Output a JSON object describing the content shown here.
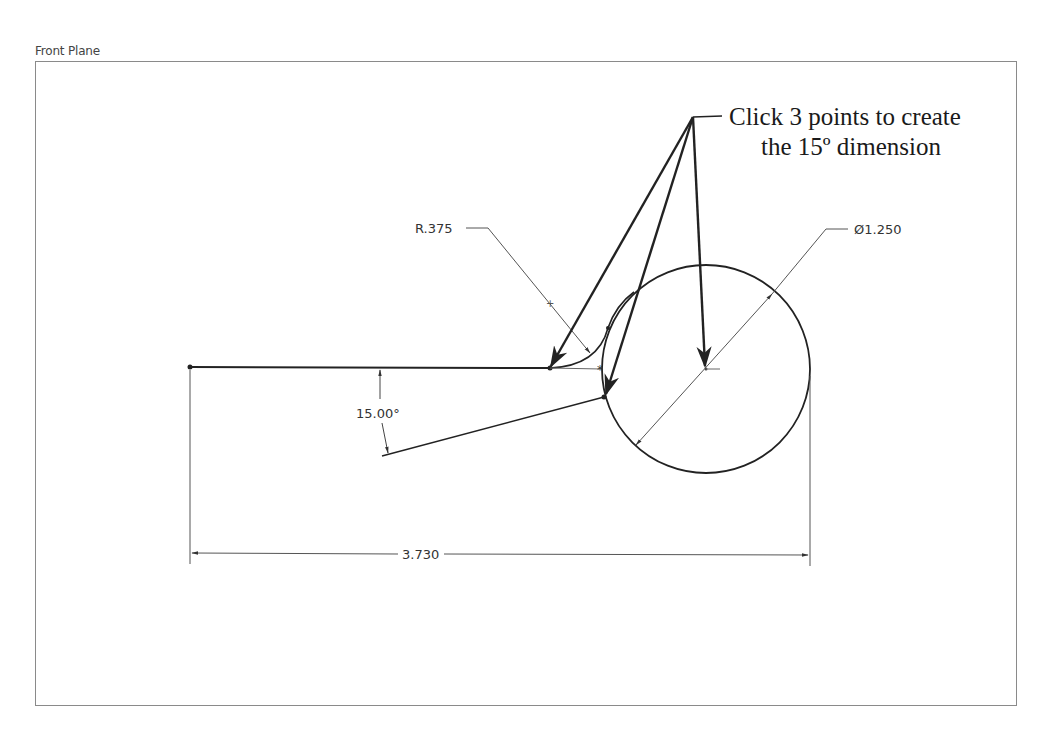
{
  "header": {
    "cut_title": ""
  },
  "sketch": {
    "plane_label": "Front Plane"
  },
  "dimensions": {
    "radius": "R.375",
    "diameter": "Ø1.250",
    "angle": "15.00°",
    "length": "3.730"
  },
  "callout": {
    "line1": "Click 3 points to create",
    "line2": "the 15º dimension"
  },
  "colors": {
    "geometry": "#222222",
    "dimension": "#555555",
    "frame": "#8a8a8a"
  }
}
